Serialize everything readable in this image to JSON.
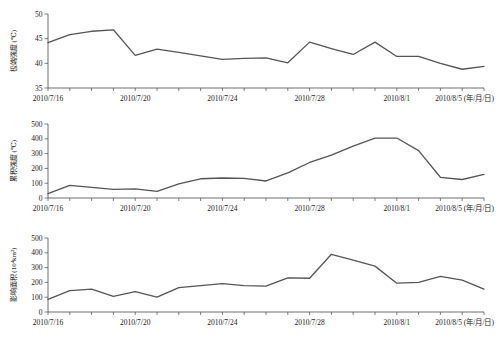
{
  "figure": {
    "background": "#ffffff",
    "line_color": "#555555",
    "axis_color": "#4a4a4a",
    "x_axis_unit_label": "(年/月/日)"
  },
  "chart_data": [
    {
      "type": "line",
      "panel": "top",
      "title": "",
      "ylabel": "极端强度 (℃)",
      "xlabel": "2010/8/5 (年/月/日)",
      "ylim": [
        35,
        50
      ],
      "yticks": [
        35,
        40,
        45,
        50
      ],
      "ytick_labels": [
        "35",
        "40",
        "45",
        "50"
      ],
      "xtick_labels": [
        "2010/7/16",
        "2010/7/20",
        "2010/7/24",
        "2010/7/28",
        "2010/8/1",
        "2010/8/5 (年/月/日)"
      ],
      "xtick_positions": [
        0,
        4,
        8,
        12,
        16,
        20
      ],
      "grid": false,
      "legend": false,
      "x": [
        0,
        1,
        2,
        3,
        4,
        5,
        6,
        7,
        8,
        9,
        10,
        11,
        12,
        13,
        14,
        15,
        16,
        17,
        18,
        19,
        20
      ],
      "values": [
        44.2,
        45.8,
        46.5,
        46.8,
        41.6,
        42.9,
        42.2,
        41.5,
        40.8,
        41.0,
        41.1,
        40.1,
        44.3,
        43.0,
        41.8,
        44.3,
        41.4,
        41.4,
        40.0,
        38.8,
        39.4
      ]
    },
    {
      "type": "line",
      "panel": "middle",
      "title": "",
      "ylabel": "累积强度 (℃)",
      "xlabel": "2010/8/5 (年/月/日)",
      "ylim": [
        0,
        500
      ],
      "yticks": [
        0,
        100,
        200,
        300,
        400,
        500
      ],
      "ytick_labels": [
        "0",
        "100",
        "200",
        "300",
        "400",
        "500"
      ],
      "xtick_labels": [
        "2010/7/16",
        "2010/7/20",
        "2010/7/24",
        "2010/7/28",
        "2010/8/1",
        "2010/8/5 (年/月/日)"
      ],
      "xtick_positions": [
        0,
        4,
        8,
        12,
        16,
        20
      ],
      "grid": false,
      "legend": false,
      "x": [
        0,
        1,
        2,
        3,
        4,
        5,
        6,
        7,
        8,
        9,
        10,
        11,
        12,
        13,
        14,
        15,
        16,
        17,
        18,
        19,
        20
      ],
      "values": [
        30,
        85,
        72,
        58,
        62,
        45,
        95,
        130,
        135,
        133,
        115,
        170,
        240,
        290,
        350,
        405,
        405,
        320,
        140,
        125,
        160
      ]
    },
    {
      "type": "line",
      "panel": "bottom",
      "title": "",
      "ylabel": "影响面积 (10⁴km²)",
      "xlabel": "2010/8/5 (年/月/日)",
      "ylim": [
        0,
        500
      ],
      "yticks": [
        0,
        100,
        200,
        300,
        400,
        500
      ],
      "ytick_labels": [
        "0",
        "100",
        "200",
        "300",
        "400",
        "500"
      ],
      "xtick_labels": [
        "2010/7/16",
        "2010/7/20",
        "2010/7/24",
        "2010/7/28",
        "2010/8/1",
        "2010/8/5 (年/月/日)"
      ],
      "xtick_positions": [
        0,
        4,
        8,
        12,
        16,
        20
      ],
      "grid": false,
      "legend": false,
      "x": [
        0,
        1,
        2,
        3,
        4,
        5,
        6,
        7,
        8,
        9,
        10,
        11,
        12,
        13,
        14,
        15,
        16,
        17,
        18,
        19,
        20
      ],
      "values": [
        85,
        145,
        155,
        105,
        138,
        100,
        165,
        178,
        192,
        178,
        175,
        230,
        228,
        390,
        350,
        310,
        195,
        200,
        240,
        215,
        155
      ]
    }
  ]
}
